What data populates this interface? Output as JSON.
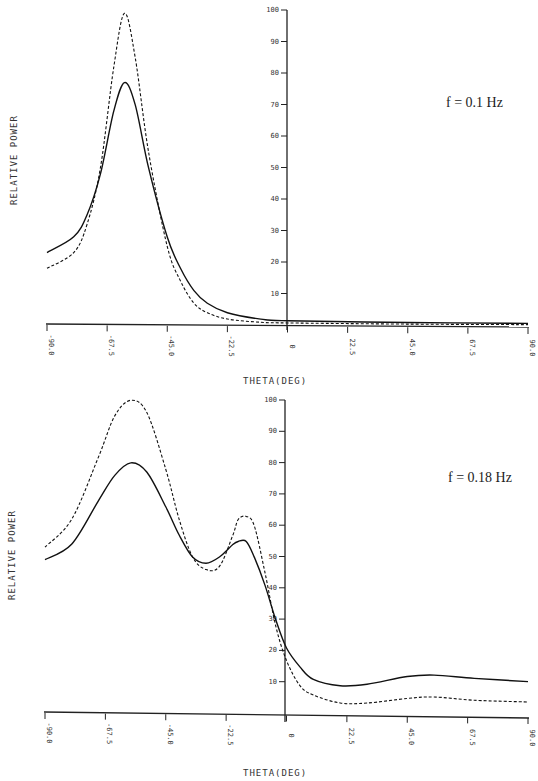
{
  "chart_data": [
    {
      "type": "line",
      "title": "",
      "annotation": "f = 0.1 Hz",
      "xlabel": "THETA(DEG)",
      "ylabel": "RELATIVE POWER",
      "xlim": [
        -90,
        90
      ],
      "ylim": [
        0,
        100
      ],
      "xticks": [
        "-90.0",
        "-67.5",
        "-45.0",
        "-22.5",
        "0",
        "22.5",
        "45.0",
        "67.5",
        "90.0"
      ],
      "yticks": [
        "10",
        "20",
        "30",
        "40",
        "50",
        "60",
        "70",
        "80",
        "90",
        "100"
      ],
      "grid": false,
      "legend": null,
      "x": [
        -90,
        -80,
        -75,
        -70,
        -65,
        -61,
        -57,
        -52,
        -45,
        -40,
        -35,
        -30,
        -22.5,
        -10,
        0,
        45,
        90
      ],
      "series": [
        {
          "name": "solid",
          "style": "solid",
          "values": [
            23,
            28,
            35,
            48,
            68,
            77,
            70,
            50,
            28,
            18,
            11,
            7,
            4,
            2,
            1.5,
            1,
            0.8
          ]
        },
        {
          "name": "dashed",
          "style": "dashed",
          "values": [
            18,
            23,
            32,
            50,
            82,
            99,
            85,
            55,
            25,
            14,
            7,
            4,
            2,
            1,
            0.8,
            0.5,
            0.4
          ]
        }
      ]
    },
    {
      "type": "line",
      "title": "",
      "annotation": "f = 0.18 Hz",
      "xlabel": "THETA(DEG)",
      "ylabel": "RELATIVE POWER",
      "xlim": [
        -90,
        90
      ],
      "ylim": [
        0,
        100
      ],
      "xticks": [
        "-90.0",
        "-67.5",
        "-45.0",
        "-22.5",
        "0",
        "22.5",
        "45.0",
        "67.5",
        "90.0"
      ],
      "yticks": [
        "10",
        "20",
        "30",
        "40",
        "50",
        "60",
        "70",
        "80",
        "90",
        "100"
      ],
      "grid": false,
      "legend": null,
      "x": [
        -90,
        -80,
        -70,
        -64,
        -58,
        -52,
        -45,
        -40,
        -35,
        -30,
        -25,
        -20,
        -18,
        -15,
        -12,
        -8,
        -4,
        0,
        5,
        10,
        20,
        30,
        45,
        55,
        70,
        90
      ],
      "series": [
        {
          "name": "solid",
          "style": "solid",
          "values": [
            49,
            54,
            68,
            76,
            80,
            77,
            66,
            57,
            50,
            48,
            50,
            54,
            55,
            55,
            50,
            41,
            30,
            21,
            15,
            11,
            9,
            9.5,
            12,
            12.5,
            11.5,
            10.5
          ]
        },
        {
          "name": "dashed",
          "style": "dashed",
          "values": [
            53,
            62,
            82,
            95,
            100,
            96,
            78,
            62,
            50,
            46,
            47,
            57,
            62,
            63,
            60,
            45,
            28,
            17,
            9,
            6,
            3.5,
            3.5,
            5,
            5.5,
            4.5,
            4
          ]
        }
      ]
    }
  ],
  "panels": [
    {
      "annotation": "f = 0.1 Hz",
      "xlabel": "THETA(DEG)",
      "ylabel": "RELATIVE POWER"
    },
    {
      "annotation": "f = 0.18 Hz",
      "xlabel": "THETA(DEG)",
      "ylabel": "RELATIVE POWER"
    }
  ]
}
